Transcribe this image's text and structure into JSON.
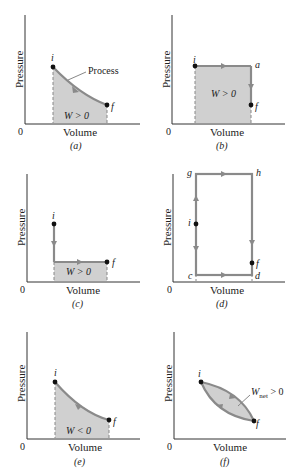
{
  "colors": {
    "curve": "#8a8a8a",
    "fill": "#d0d0d0",
    "axis": "#333333",
    "point": "#111111"
  },
  "axes": {
    "x_label": "Volume",
    "y_label": "Pressure",
    "origin": "0"
  },
  "panels": [
    {
      "id": "a",
      "caption": "(a)",
      "points": [
        "i",
        "f"
      ],
      "work_label": "W > 0",
      "process_label": "Process"
    },
    {
      "id": "b",
      "caption": "(b)",
      "points": [
        "i",
        "a",
        "f"
      ],
      "work_label": "W > 0"
    },
    {
      "id": "c",
      "caption": "(c)",
      "points": [
        "i",
        "f"
      ],
      "work_label": "W > 0"
    },
    {
      "id": "d",
      "caption": "(d)",
      "points": [
        "g",
        "h",
        "i",
        "f",
        "c",
        "d"
      ]
    },
    {
      "id": "e",
      "caption": "(e)",
      "points": [
        "i",
        "f"
      ],
      "work_label": "W < 0"
    },
    {
      "id": "f",
      "caption": "(f)",
      "points": [
        "i",
        "f"
      ],
      "work_label_main": "W",
      "work_label_sub": "net",
      "work_label_rest": " > 0"
    }
  ]
}
